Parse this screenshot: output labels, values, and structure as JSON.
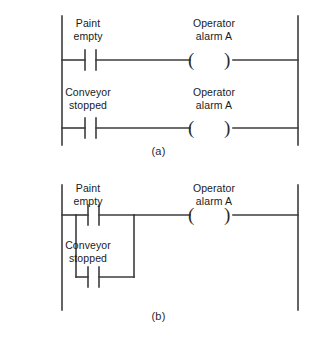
{
  "figure": {
    "type": "ladder-logic-diagram",
    "background_color": "#ffffff",
    "line_color": "#3d3d3d",
    "text_color": "#1a1a1a"
  },
  "diagrams": [
    {
      "id": "a",
      "caption": "(a)",
      "description": "Two separate rungs, each with one normally-open contact energizing the same output coil",
      "rungs": [
        {
          "contact": {
            "label_line1": "Paint",
            "label_line2": "empty",
            "symbol": "normally-open-contact"
          },
          "coil": {
            "label_line1": "Operator",
            "label_line2": "alarm A",
            "symbol": "output-coil",
            "open_paren": "(",
            "close_paren": ")"
          }
        },
        {
          "contact": {
            "label_line1": "Conveyor",
            "label_line2": "stopped",
            "symbol": "normally-open-contact"
          },
          "coil": {
            "label_line1": "Operator",
            "label_line2": "alarm A",
            "symbol": "output-coil",
            "open_paren": "(",
            "close_paren": ")"
          }
        }
      ]
    },
    {
      "id": "b",
      "caption": "(b)",
      "description": "Single rung with two normally-open contacts in parallel (OR branch) energizing one output coil",
      "branches": [
        {
          "contact": {
            "label_line1": "Paint",
            "label_line2": "empty",
            "symbol": "normally-open-contact"
          }
        },
        {
          "contact": {
            "label_line1": "Conveyor",
            "label_line2": "stopped",
            "symbol": "normally-open-contact"
          }
        }
      ],
      "coil": {
        "label_line1": "Operator",
        "label_line2": "alarm A",
        "symbol": "output-coil",
        "open_paren": "(",
        "close_paren": ")"
      }
    }
  ]
}
